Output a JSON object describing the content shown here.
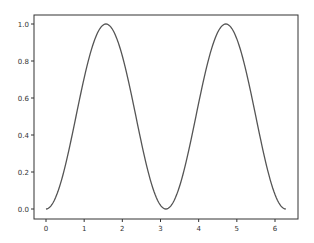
{
  "chart_data": {
    "type": "line",
    "title": "",
    "xlabel": "",
    "ylabel": "",
    "xlim": [
      -0.31,
      6.6
    ],
    "ylim": [
      -0.05,
      1.05
    ],
    "grid": false,
    "legend": null,
    "x_ticks": [
      "0",
      "1",
      "2",
      "3",
      "4",
      "5",
      "6"
    ],
    "y_ticks": [
      "0.0",
      "0.2",
      "0.4",
      "0.6",
      "0.8",
      "1.0"
    ],
    "series": [
      {
        "name": "sin(x)^2",
        "function": "sin(x)^2",
        "x_range": [
          0,
          6.283
        ],
        "color": "#555555",
        "x": [
          0,
          0.5,
          1.0,
          1.5708,
          2.0,
          2.5,
          3.1416,
          3.5,
          4.0,
          4.7124,
          5.0,
          5.5,
          6.283
        ],
        "values": [
          0.0,
          0.23,
          0.708,
          1.0,
          0.827,
          0.358,
          0.0,
          0.123,
          0.573,
          1.0,
          0.919,
          0.498,
          0.0
        ]
      }
    ]
  },
  "axes": {
    "frame_color": "#333333",
    "line_color": "#555555"
  }
}
